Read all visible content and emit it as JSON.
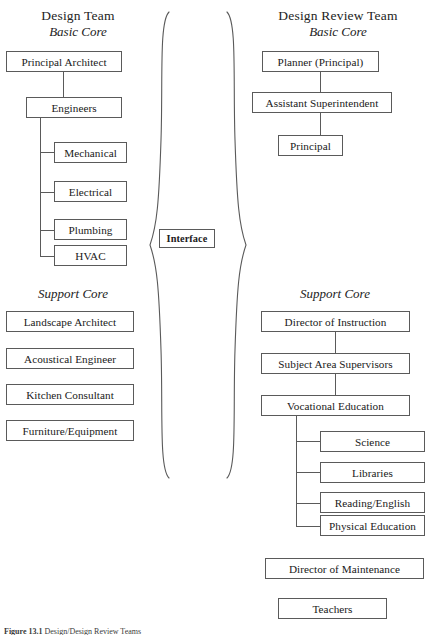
{
  "figure": {
    "caption_number": "Figure 13.1",
    "caption_text": "Design/Design Review Teams"
  },
  "left_column": {
    "title": "Design Team",
    "subtitle": "Basic Core",
    "support_label": "Support Core",
    "basic_core": {
      "root": "Principal Architect",
      "second": "Engineers",
      "children": [
        "Mechanical",
        "Electrical",
        "Plumbing",
        "HVAC"
      ]
    },
    "support_core": [
      "Landscape Architect",
      "Acoustical Engineer",
      "Kitchen Consultant",
      "Furniture/Equipment"
    ]
  },
  "center": {
    "interface_label": "Interface",
    "left_brace": "left-curly-brace",
    "right_brace": "right-curly-brace"
  },
  "right_column": {
    "title": "Design Review Team",
    "subtitle": "Basic Core",
    "support_label": "Support Core",
    "basic_core": [
      "Planner (Principal)",
      "Assistant Superintendent",
      "Principal"
    ],
    "support_core": {
      "chain": [
        "Director of Instruction",
        "Subject Area Supervisors",
        "Vocational Education"
      ],
      "children": [
        "Science",
        "Libraries",
        "Reading/English",
        "Physical Education"
      ],
      "standalone": [
        "Director of Maintenance",
        "Teachers"
      ]
    }
  },
  "colors": {
    "line": "#5a5a5a",
    "text": "#202020",
    "background": "#ffffff"
  }
}
